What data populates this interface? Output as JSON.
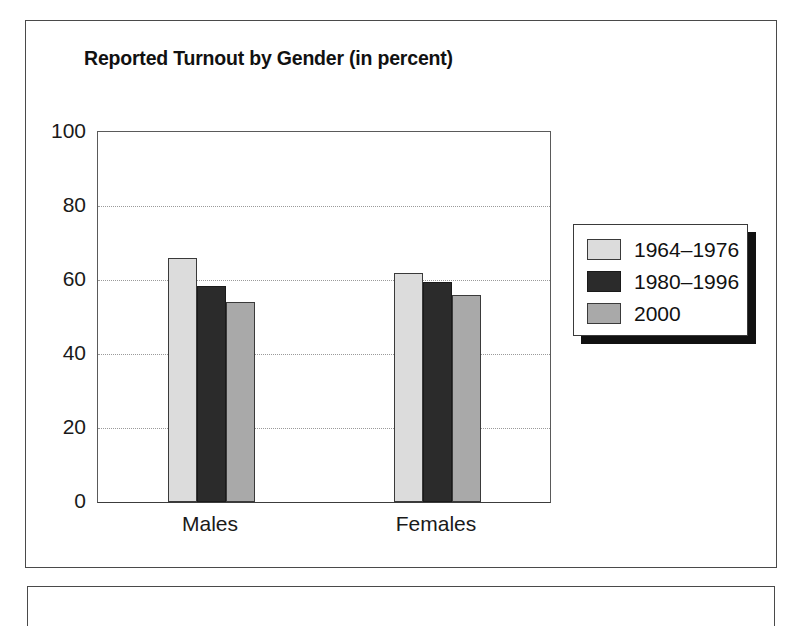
{
  "figure": {
    "has_outer_border": true,
    "has_lower_partial_border": true
  },
  "chart_data": {
    "type": "bar",
    "title": "Reported Turnout by Gender (in percent)",
    "xlabel": "",
    "ylabel": "",
    "categories": [
      "Males",
      "Females"
    ],
    "series": [
      {
        "name": "1964–1976",
        "color": "#dcdcdc",
        "values": [
          66,
          62
        ]
      },
      {
        "name": "1980–1996",
        "color": "#2b2b2b",
        "values": [
          58.5,
          59.5
        ]
      },
      {
        "name": "2000",
        "color": "#a9a9a9",
        "values": [
          54,
          56
        ]
      }
    ],
    "ylim": [
      0,
      100
    ],
    "yticks": [
      0,
      20,
      40,
      60,
      80,
      100
    ],
    "ytick_labels": [
      "0",
      "20",
      "40",
      "60",
      "80",
      "100"
    ],
    "grid": true,
    "gridlines_at": [
      20,
      40,
      60,
      80
    ],
    "grid_style": "dotted",
    "legend_position": "right-outside",
    "legend_has_shadow": true
  }
}
